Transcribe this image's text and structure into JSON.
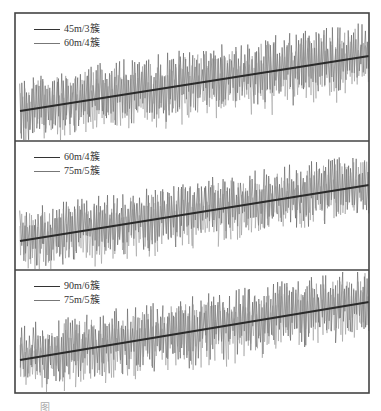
{
  "chart_data": [
    {
      "type": "line",
      "panel": 1,
      "title": "",
      "xlabel": "",
      "ylabel": "",
      "grid": false,
      "legend_position": "upper-left",
      "series": [
        {
          "name": "45m/3簇",
          "color": "#333333",
          "role": "dense signal trace"
        },
        {
          "name": "60m/4簇",
          "color": "#777777",
          "role": "dense signal trace"
        }
      ],
      "trend": {
        "x_start": 20,
        "y_start": 111,
        "x_end": 369,
        "y_end": 56,
        "color": "#2a2a2a"
      },
      "amplitude_px": 28
    },
    {
      "type": "line",
      "panel": 2,
      "title": "",
      "xlabel": "",
      "ylabel": "",
      "grid": false,
      "legend_position": "upper-left",
      "series": [
        {
          "name": "60m/4簇",
          "color": "#333333",
          "role": "dense signal trace"
        },
        {
          "name": "75m/5簇",
          "color": "#777777",
          "role": "dense signal trace"
        }
      ],
      "trend": {
        "x_start": 20,
        "y_start": 241,
        "x_end": 369,
        "y_end": 185,
        "color": "#2a2a2a"
      },
      "amplitude_px": 26
    },
    {
      "type": "line",
      "panel": 3,
      "title": "",
      "xlabel": "",
      "ylabel": "",
      "grid": false,
      "legend_position": "upper-left",
      "series": [
        {
          "name": "90m/6簇",
          "color": "#333333",
          "role": "dense signal trace"
        },
        {
          "name": "75m/5簇",
          "color": "#777777",
          "role": "dense signal trace"
        }
      ],
      "trend": {
        "x_start": 20,
        "y_start": 360,
        "x_end": 369,
        "y_end": 302,
        "color": "#2a2a2a"
      },
      "amplitude_px": 28
    }
  ],
  "frame": {
    "left": 15,
    "top": 13,
    "right": 369,
    "bottom": 393,
    "dividers": [
      141,
      270
    ],
    "color": "#444444"
  },
  "legends": [
    {
      "top": 22,
      "items": [
        "45m/3簇",
        "60m/4簇"
      ]
    },
    {
      "top": 150,
      "items": [
        "60m/4簇",
        "75m/5簇"
      ]
    },
    {
      "top": 279,
      "items": [
        "90m/6簇",
        "75m/5簇"
      ]
    }
  ],
  "caption": "图"
}
